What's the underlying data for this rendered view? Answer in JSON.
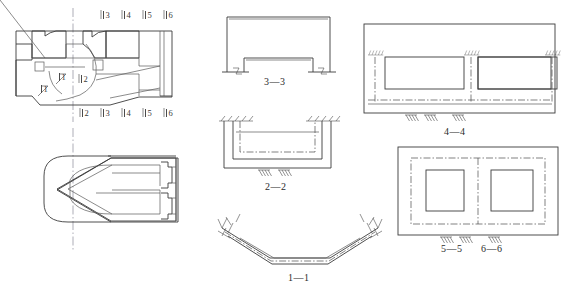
{
  "drawing": {
    "title_visible": false,
    "background_color": "#ffffff",
    "line_color": "#3b3b3b",
    "centerline_color": "#8a8a9a"
  },
  "views": {
    "main_section": {
      "name": "longitudinal-section-view",
      "top_section_marks": [
        "3",
        "4",
        "5",
        "6"
      ],
      "bottom_section_marks": [
        "2",
        "3",
        "4",
        "5",
        "6"
      ],
      "inner_marks": [
        "2"
      ],
      "cut_marks": [
        "1",
        "1"
      ]
    },
    "plan": {
      "name": "plan-view",
      "caption": ""
    },
    "section_3_3": {
      "caption": "3—3"
    },
    "section_2_2": {
      "caption": "2—2"
    },
    "section_1_1": {
      "caption": "1—1"
    },
    "section_4_4": {
      "caption": "4—4"
    },
    "section_5_5": {
      "caption": "5—5"
    },
    "section_6_6": {
      "caption": "6—6"
    }
  },
  "icons": {
    "support_hatch": "fixed-support-hatch-icon",
    "ground_hatch": "ground-hatch-icon",
    "cut_arrow": "section-cut-arrow-icon"
  }
}
